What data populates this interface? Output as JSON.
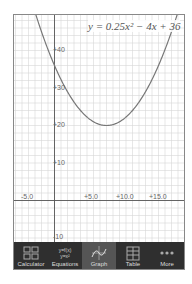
{
  "graph": {
    "equation": "y = 0.25x² − 4x + 36",
    "x_labels": [
      {
        "text": "-5.0",
        "x": 21,
        "y": 193
      },
      {
        "text": "+5.0",
        "x": 84,
        "y": 193
      },
      {
        "text": "+10.0",
        "x": 116,
        "y": 193
      },
      {
        "text": "+15.0",
        "x": 149,
        "y": 193
      }
    ],
    "y_labels": [
      {
        "text": "+40",
        "x": 53,
        "y": 46
      },
      {
        "text": "+30",
        "x": 53,
        "y": 84
      },
      {
        "text": "+20",
        "x": 53,
        "y": 121
      },
      {
        "text": "+10",
        "x": 53,
        "y": 159
      },
      {
        "text": "-10",
        "x": 53,
        "y": 233
      }
    ]
  },
  "tabs": [
    {
      "label": "Calculator",
      "icon": "calculator-icon",
      "active": false
    },
    {
      "label": "Equations",
      "icon": "equations-icon",
      "icon_text": [
        "y=f(x)",
        "y=x²"
      ],
      "active": false
    },
    {
      "label": "Graph",
      "icon": "graph-icon",
      "active": true
    },
    {
      "label": "Table",
      "icon": "table-icon",
      "active": false
    },
    {
      "label": "More",
      "icon": "more-icon",
      "active": false
    }
  ],
  "colors": {
    "grid": "#d6d6d6",
    "axis": "#555555",
    "curve": "#777777",
    "tabbar": "#2f2f2f",
    "tab_active": "#555555"
  }
}
